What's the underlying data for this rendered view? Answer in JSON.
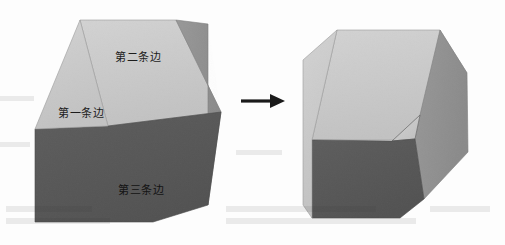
{
  "figure": {
    "name": "cube-edge-transformation-figure",
    "background_color": "#fdfdfd",
    "width": 505,
    "height": 245
  },
  "palette": {
    "face_top_light": "#c9c9c9",
    "face_right_medium": "#919191",
    "face_front_dark": "#585858",
    "face_notch_light": "#cacaca",
    "outline": "#6e6e6e",
    "arrow": "#1a1a1a",
    "label_text": "#1c1c1c"
  },
  "left_cube": {
    "name": "source-cube",
    "faces": [
      {
        "id": "top",
        "name": "cube-face-top",
        "color": "#c9c9c9",
        "points": "80,20 176,20 207,108 108,122"
      },
      {
        "id": "front",
        "name": "cube-face-front",
        "color": "#585858",
        "points": "35,128 108,122 207,108 207,213 155,222 35,222"
      },
      {
        "id": "right",
        "name": "cube-face-right",
        "color": "#919191",
        "points": "176,20 207,22 221,115 207,213"
      }
    ],
    "labels": [
      {
        "id": "edge1",
        "text": "第一条边",
        "face": "top",
        "position": "left-lower"
      },
      {
        "id": "edge2",
        "text": "第二条边",
        "face": "top",
        "position": "center-upper"
      },
      {
        "id": "edge3",
        "text": "第三条边",
        "face": "front",
        "position": "center-lower"
      }
    ]
  },
  "arrow": {
    "name": "transformation-arrow",
    "direction": "right",
    "color": "#1a1a1a",
    "label": ""
  },
  "right_cube": {
    "name": "result-cube",
    "annotation": "triangular notch facet revealed at right edge",
    "faces": [
      {
        "id": "top",
        "name": "cube-face-top",
        "color": "#c9c9c9"
      },
      {
        "id": "front",
        "name": "cube-face-front",
        "color": "#585858"
      },
      {
        "id": "right",
        "name": "cube-face-right",
        "color": "#919191"
      },
      {
        "id": "notch",
        "name": "cube-face-notch",
        "color": "#cacaca"
      }
    ]
  },
  "ghost_text": {
    "name": "scan-ghost-text",
    "visible": true,
    "description": "faint show-through text from reverse page"
  }
}
